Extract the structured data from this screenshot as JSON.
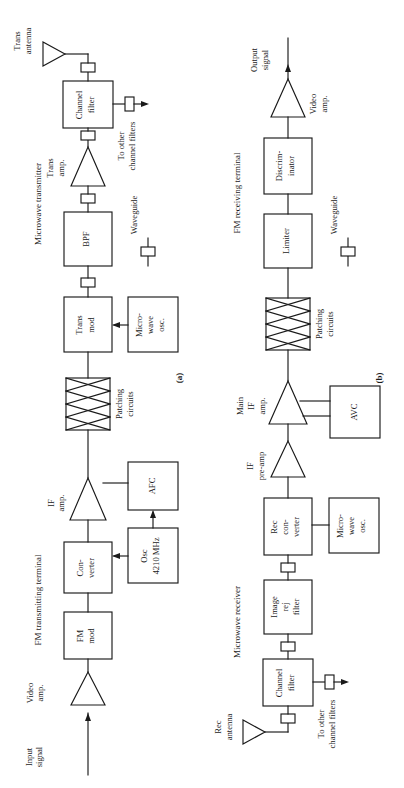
{
  "figure": {
    "caption_a": "(a)",
    "caption_b": "(b)",
    "orientation": "rotated-90-ccw",
    "line_color": "#1a1a1a",
    "background": "#ffffff"
  },
  "panel_a": {
    "section_titles": {
      "left": "FM transmitting terminal",
      "right": "Microwave transmitter"
    },
    "legend": {
      "waveguide_label": "Waveguide"
    },
    "nodes": [
      {
        "id": "input-signal",
        "type": "label",
        "label": "Input\nsignal"
      },
      {
        "id": "video-amp",
        "type": "triangle",
        "label": "Video\namp."
      },
      {
        "id": "fm-mod",
        "type": "box",
        "label": "FM\nmod"
      },
      {
        "id": "converter",
        "type": "box",
        "label": "Con-\nverter"
      },
      {
        "id": "if-amp",
        "type": "triangle",
        "label": "IF\namp."
      },
      {
        "id": "afc",
        "type": "box",
        "label": "AFC"
      },
      {
        "id": "osc-4210",
        "type": "box",
        "label": "Osc\n4210 MHz"
      },
      {
        "id": "patching-circuits",
        "type": "patch",
        "label": "Patching\ncircuits"
      },
      {
        "id": "trans-mod",
        "type": "box",
        "label": "Trans\nmod"
      },
      {
        "id": "microwave-osc",
        "type": "box",
        "label": "Micro-\nwave\nosc."
      },
      {
        "id": "bpf",
        "type": "box",
        "label": "BPF"
      },
      {
        "id": "trans-amp",
        "type": "triangle",
        "label": "Trans\namp."
      },
      {
        "id": "channel-filter",
        "type": "box",
        "label": "Channel\nfilter"
      },
      {
        "id": "to-other-filters",
        "type": "label",
        "label": "To other\nchannel filters"
      },
      {
        "id": "trans-antenna",
        "type": "antenna",
        "label": "Trans\nantenna"
      }
    ]
  },
  "panel_b": {
    "section_titles": {
      "left": "Microwave receiver",
      "right": "FM receiving terminal"
    },
    "legend": {
      "waveguide_label": "Waveguide"
    },
    "nodes": [
      {
        "id": "rec-antenna",
        "type": "antenna",
        "label": "Rec\nantenna"
      },
      {
        "id": "channel-filter",
        "type": "box",
        "label": "Channel\nfilter"
      },
      {
        "id": "to-other-filters",
        "type": "label",
        "label": "To other\nchannel filters"
      },
      {
        "id": "image-rej-filter",
        "type": "box",
        "label": "Image\nrej\nfilter"
      },
      {
        "id": "rec-converter",
        "type": "box",
        "label": "Rec\ncon-\nverter"
      },
      {
        "id": "microwave-osc",
        "type": "box",
        "label": "Micro-\nwave\nosc."
      },
      {
        "id": "if-pre-amp",
        "type": "triangle",
        "label": "IF\npre-amp"
      },
      {
        "id": "main-if-amp",
        "type": "triangle",
        "label": "Main\nIF\namp."
      },
      {
        "id": "avc",
        "type": "box",
        "label": "AVC"
      },
      {
        "id": "patching-circuits",
        "type": "patch",
        "label": "Patching\ncircuits"
      },
      {
        "id": "limiter",
        "type": "box",
        "label": "Limiter"
      },
      {
        "id": "discriminator",
        "type": "box",
        "label": "Discrim-\ninator"
      },
      {
        "id": "video-amp",
        "type": "triangle",
        "label": "Video\namp."
      },
      {
        "id": "output-signal",
        "type": "label",
        "label": "Output\nsignal"
      }
    ]
  },
  "text": {
    "panel_a_title_left": "FM transmitting terminal",
    "panel_a_title_right": "Microwave transmitter",
    "panel_b_title_left": "Microwave receiver",
    "panel_b_title_right": "FM receiving terminal",
    "input_signal": "Input signal",
    "input_signal_l1": "Input",
    "input_signal_l2": "signal",
    "output_signal_l1": "Output",
    "output_signal_l2": "signal",
    "video_amp_l1": "Video",
    "video_amp_l2": "amp.",
    "fm_mod_l1": "FM",
    "fm_mod_l2": "mod",
    "converter_l1": "Con-",
    "converter_l2": "verter",
    "if_amp_l1": "IF",
    "if_amp_l2": "amp.",
    "afc": "AFC",
    "osc_l1": "Osc",
    "osc_l2": "4210 MHz",
    "patching_l1": "Patching",
    "patching_l2": "circuits",
    "trans_mod_l1": "Trans",
    "trans_mod_l2": "mod",
    "micro_l1": "Micro-",
    "micro_l2": "wave",
    "micro_l3": "osc.",
    "bpf": "BPF",
    "trans_amp_l1": "Trans",
    "trans_amp_l2": "amp.",
    "channel_filter_l1": "Channel",
    "channel_filter_l2": "filter",
    "to_other_l1": "To other",
    "to_other_l2": "channel filters",
    "trans_antenna_l1": "Trans",
    "trans_antenna_l2": "antenna",
    "rec_antenna_l1": "Rec",
    "rec_antenna_l2": "antenna",
    "image_rej_l1": "Image",
    "image_rej_l2": "rej",
    "image_rej_l3": "filter",
    "rec_conv_l1": "Rec",
    "rec_conv_l2": "con-",
    "rec_conv_l3": "verter",
    "if_pre_l1": "IF",
    "if_pre_l2": "pre-amp",
    "main_if_l1": "Main",
    "main_if_l2": "IF",
    "main_if_l3": "amp.",
    "avc": "AVC",
    "limiter": "Limiter",
    "discrim_l1": "Discrim-",
    "discrim_l2": "inator",
    "waveguide": "Waveguide",
    "caption_a": "(a)",
    "caption_b": "(b)"
  }
}
